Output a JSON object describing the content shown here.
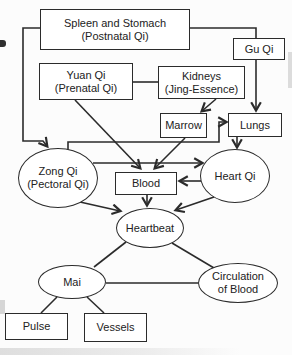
{
  "diagram": {
    "nodes": {
      "spleen_stomach": {
        "line1": "Spleen and Stomach",
        "line2": "(Postnatal Qi)"
      },
      "gu_qi": {
        "line1": "Gu Qi"
      },
      "yuan_qi": {
        "line1": "Yuan Qi",
        "line2": "(Prenatal Qi)"
      },
      "kidneys": {
        "line1": "Kidneys",
        "line2": "(Jing-Essence)"
      },
      "marrow": {
        "line1": "Marrow"
      },
      "lungs": {
        "line1": "Lungs"
      },
      "zong_qi": {
        "line1": "Zong Qi",
        "line2": "(Pectoral Qi)"
      },
      "heart_qi": {
        "line1": "Heart Qi"
      },
      "blood": {
        "line1": "Blood"
      },
      "heartbeat": {
        "line1": "Heartbeat"
      },
      "mai": {
        "line1": "Mai"
      },
      "circulation_of_blood": {
        "line1": "Circulation",
        "line2": "of Blood"
      },
      "pulse": {
        "line1": "Pulse"
      },
      "vessels": {
        "line1": "Vessels"
      }
    },
    "edges": [
      {
        "from": "Spleen and Stomach (Postnatal Qi)",
        "to": "Zong Qi (Pectoral Qi)",
        "arrow": true
      },
      {
        "from": "Spleen and Stomach (Postnatal Qi)",
        "to": "Gu Qi",
        "arrow": false
      },
      {
        "from": "Gu Qi",
        "to": "Lungs",
        "arrow": true
      },
      {
        "from": "Yuan Qi (Prenatal Qi)",
        "to": "Kidneys (Jing-Essence)",
        "arrow": false
      },
      {
        "from": "Yuan Qi (Prenatal Qi)",
        "to": "Blood",
        "arrow": true
      },
      {
        "from": "Kidneys (Jing-Essence)",
        "to": "Marrow",
        "arrow": true
      },
      {
        "from": "Marrow",
        "to": "Blood",
        "arrow": true
      },
      {
        "from": "Zong Qi (Pectoral Qi)",
        "to": "Lungs",
        "arrow": true
      },
      {
        "from": "Lungs",
        "to": "Heart Qi",
        "arrow": true
      },
      {
        "from": "Zong Qi (Pectoral Qi)",
        "to": "Heart Qi",
        "arrow": true
      },
      {
        "from": "Heart Qi",
        "to": "Blood",
        "arrow": true
      },
      {
        "from": "Blood",
        "to": "Heartbeat",
        "arrow": true
      },
      {
        "from": "Zong Qi (Pectoral Qi)",
        "to": "Heartbeat",
        "arrow": true
      },
      {
        "from": "Heart Qi",
        "to": "Heartbeat",
        "arrow": true
      },
      {
        "from": "Heartbeat",
        "to": "Mai",
        "arrow": false
      },
      {
        "from": "Heartbeat",
        "to": "Circulation of Blood",
        "arrow": false
      },
      {
        "from": "Mai",
        "to": "Circulation of Blood",
        "arrow": false
      },
      {
        "from": "Mai",
        "to": "Pulse",
        "arrow": false
      },
      {
        "from": "Mai",
        "to": "Vessels",
        "arrow": false
      }
    ],
    "colors": {
      "line": "#2b2b2b",
      "text": "#222222",
      "background": "#fcfcfc",
      "node_fill": "#ffffff"
    }
  }
}
